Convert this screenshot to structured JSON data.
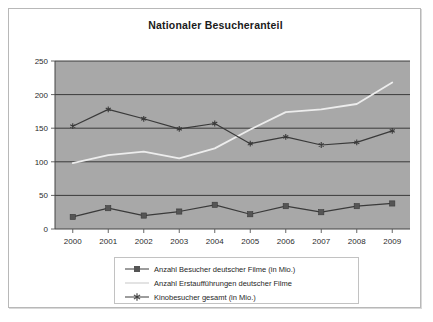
{
  "chart": {
    "title": "Nationaler Besucheranteil"
  },
  "colors": {
    "plot_background": "#a8a8a8",
    "gridline": "#2e2e2e",
    "series_dark": "#3a3a3a",
    "series_light": "#ededed",
    "frame_border": "#b8b8b8",
    "legend_border": "#c2c2c2",
    "text": "#1f1f1f"
  },
  "legend": {
    "items": [
      {
        "label": "Anzahl Besucher deutscher Filme (in Mio.)",
        "marker": "square",
        "color": "#3a3a3a"
      },
      {
        "label": "Anzahl Erstaufführungen deutscher Filme",
        "marker": "none",
        "color": "#ededed"
      },
      {
        "label": "Kinobesucher gesamt (in Mio.)",
        "marker": "star",
        "color": "#3a3a3a"
      }
    ]
  },
  "chart_data": {
    "type": "line",
    "title": "Nationaler Besucheranteil",
    "xlabel": "",
    "ylabel": "",
    "grid": true,
    "legend_position": "bottom",
    "categories": [
      "2000",
      "2001",
      "2002",
      "2003",
      "2004",
      "2005",
      "2006",
      "2007",
      "2008",
      "2009"
    ],
    "x_tick_labels": [
      "2000",
      "2001",
      "2002",
      "2003",
      "2004",
      "2005",
      "2006",
      "2007",
      "2008",
      "2009"
    ],
    "y_tick_labels": [
      "0",
      "50",
      "100",
      "150",
      "200",
      "250"
    ],
    "y_ticks": [
      0,
      50,
      100,
      150,
      200,
      250
    ],
    "ylim": [
      0,
      250
    ],
    "series": [
      {
        "name": "Anzahl Besucher deutscher Filme (in Mio.)",
        "marker": "square",
        "color": "#3a3a3a",
        "values": [
          18,
          31,
          20,
          26,
          36,
          22,
          34,
          25,
          34,
          38
        ]
      },
      {
        "name": "Anzahl Erstaufführungen deutscher Filme",
        "marker": "none",
        "color": "#ededed",
        "values": [
          98,
          110,
          115,
          105,
          120,
          148,
          174,
          178,
          186,
          218
        ]
      },
      {
        "name": "Kinobesucher gesamt (in Mio.)",
        "marker": "star",
        "color": "#3a3a3a",
        "values": [
          153,
          178,
          164,
          149,
          157,
          127,
          137,
          125,
          129,
          146
        ]
      }
    ]
  }
}
